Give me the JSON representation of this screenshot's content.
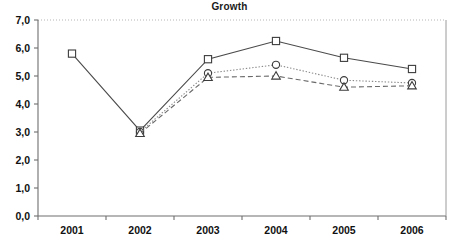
{
  "chart_data": {
    "type": "line",
    "title": "Growth",
    "xlabel": "",
    "ylabel": "",
    "categories": [
      "2001",
      "2002",
      "2003",
      "2004",
      "2005",
      "2006"
    ],
    "ylim": [
      0.0,
      7.0
    ],
    "ytick_step": 1.0,
    "ytick_labels": [
      "0,0",
      "1,0",
      "2,0",
      "3,0",
      "4,0",
      "5,0",
      "6,0",
      "7,0"
    ],
    "ytick_values": [
      0.0,
      1.0,
      2.0,
      3.0,
      4.0,
      5.0,
      6.0,
      7.0
    ],
    "grid": "top-dotted-only",
    "legend": "none",
    "decimal_separator": ",",
    "series": [
      {
        "name": "series-square",
        "marker": "square",
        "line_style": "solid",
        "color": "#4a4a4a",
        "x": [
          "2001",
          "2002",
          "2003",
          "2004",
          "2005",
          "2006"
        ],
        "values": [
          5.8,
          3.05,
          5.6,
          6.25,
          5.65,
          5.25
        ]
      },
      {
        "name": "series-circle",
        "marker": "circle",
        "line_style": "dotted",
        "color": "#8a8a8a",
        "x": [
          "2002",
          "2003",
          "2004",
          "2005",
          "2006"
        ],
        "values": [
          3.0,
          5.1,
          5.4,
          4.85,
          4.75
        ]
      },
      {
        "name": "series-triangle",
        "marker": "triangle",
        "line_style": "dashed",
        "color": "#6a6a6a",
        "x": [
          "2002",
          "2003",
          "2004",
          "2005",
          "2006"
        ],
        "values": [
          2.95,
          4.95,
          5.0,
          4.6,
          4.65
        ]
      }
    ]
  },
  "plot_geometry": {
    "left": 38,
    "right": 446,
    "top": 20,
    "bottom": 216
  }
}
